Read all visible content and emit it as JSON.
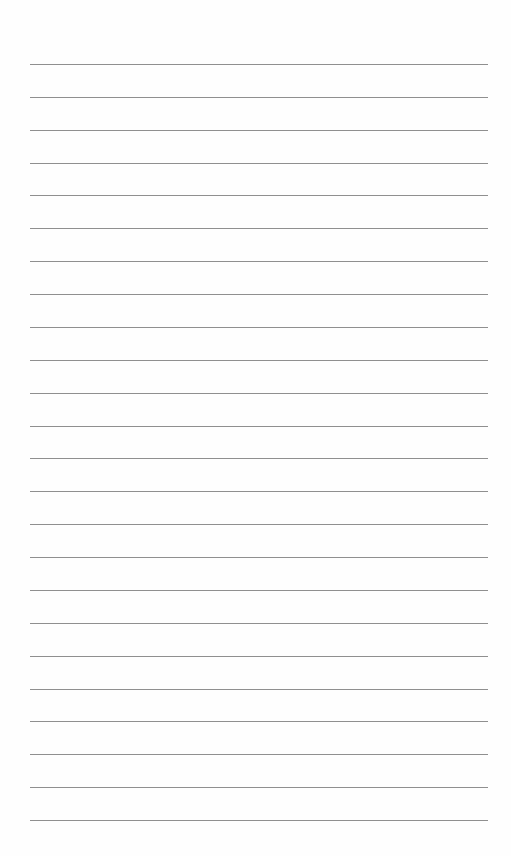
{
  "page": {
    "type": "lined-paper",
    "line_color": "#8f8f8f",
    "background": "#fefefe",
    "line_count": 24,
    "first_line_y": 64,
    "line_spacing": 32.87,
    "line_left": 30,
    "line_width": 458
  }
}
